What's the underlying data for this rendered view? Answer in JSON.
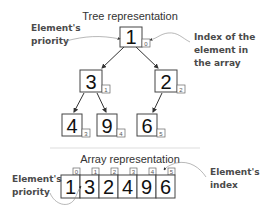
{
  "tree": {
    "title": "Tree representation",
    "nodes": [
      {
        "value": "1",
        "index": "0"
      },
      {
        "value": "3",
        "index": "1"
      },
      {
        "value": "2",
        "index": "2"
      },
      {
        "value": "4",
        "index": "3"
      },
      {
        "value": "9",
        "index": "4"
      },
      {
        "value": "6",
        "index": "5"
      }
    ],
    "annotations": {
      "priority_line1": "Element's",
      "priority_line2": "priority",
      "index_line1": "Index of the",
      "index_line2": "element in",
      "index_line3": "the array"
    }
  },
  "array": {
    "title": "Array representation",
    "cells": [
      {
        "value": "1",
        "index": "0"
      },
      {
        "value": "3",
        "index": "1"
      },
      {
        "value": "2",
        "index": "2"
      },
      {
        "value": "4",
        "index": "3"
      },
      {
        "value": "9",
        "index": "4"
      },
      {
        "value": "6",
        "index": "5"
      }
    ],
    "annotations": {
      "priority_line1": "Element's",
      "priority_line2": "priority",
      "index_line1": "Element's",
      "index_line2": "index"
    }
  }
}
